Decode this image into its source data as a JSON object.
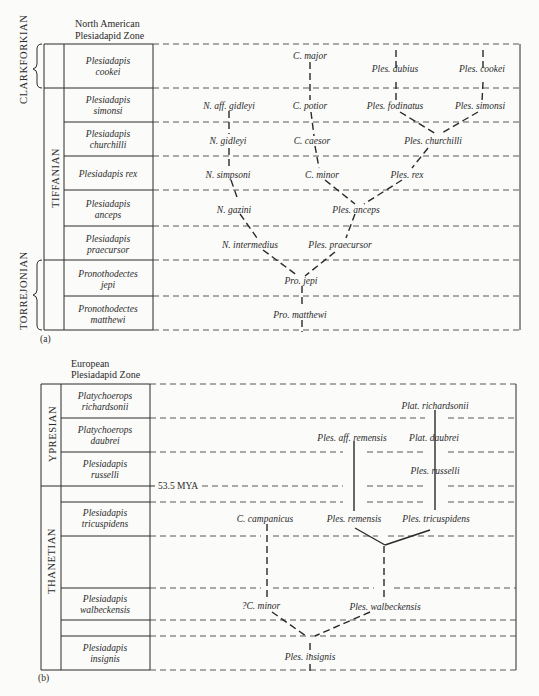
{
  "panel_a": {
    "label": "(a)",
    "header_line1": "North American",
    "header_line2": "Plesiadapid Zone",
    "eras": [
      {
        "name": "CLARKFORKIAN"
      },
      {
        "name": "TIFFANIAN"
      },
      {
        "name": "TORREJONIAN"
      }
    ],
    "zones": [
      {
        "line1": "Plesiadapis",
        "line2": "cookei"
      },
      {
        "line1": "Plesiadapis",
        "line2": "simonsi"
      },
      {
        "line1": "Plesiadapis",
        "line2": "churchilli"
      },
      {
        "line1": "Plesiadapis rex",
        "line2": ""
      },
      {
        "line1": "Plesiadapis",
        "line2": "anceps"
      },
      {
        "line1": "Plesiadapis",
        "line2": "praecursor"
      },
      {
        "line1": "Pronothodectes",
        "line2": "jepi"
      },
      {
        "line1": "Pronothodectes",
        "line2": "matthewi"
      }
    ],
    "taxa": {
      "c_major": "C. major",
      "ples_dubius": "Ples. dubius",
      "ples_cookei": "Ples. cookei",
      "n_aff_gidleyi": "N. aff. gidleyi",
      "c_potior": "C. potior",
      "ples_fodinatus": "Ples. fodinatus",
      "ples_simonsi": "Ples. simonsi",
      "n_gidleyi": "N. gidleyi",
      "c_caesor": "C. caesor",
      "ples_churchilli": "Ples. churchilli",
      "n_simpsoni": "N. simpsoni",
      "c_minor": "C. minor",
      "ples_rex": "Ples. rex",
      "n_gazini": "N. gazini",
      "ples_anceps": "Ples. anceps",
      "n_intermedius": "N. intermedius",
      "ples_praecursor": "Ples. praecursor",
      "pro_jepi": "Pro. jepi",
      "pro_matthewi": "Pro. matthewi"
    }
  },
  "panel_b": {
    "label": "(b)",
    "header_line1": "European",
    "header_line2": "Plesiadapid Zone",
    "eras": [
      {
        "name": "YPRESIAN"
      },
      {
        "name": "THANETIAN"
      }
    ],
    "zones": [
      {
        "line1": "Platychoerops",
        "line2": "richardsonii"
      },
      {
        "line1": "Platychoerops",
        "line2": "daubrei"
      },
      {
        "line1": "Plesiadapis",
        "line2": "russelli"
      },
      {
        "line1": "Plesiadapis",
        "line2": "tricuspidens"
      },
      {
        "line1": "Plesiadapis",
        "line2": "walbeckensis"
      },
      {
        "line1": "Plesiadapis",
        "line2": "insignis"
      }
    ],
    "boundary_label": "53.5 MYA",
    "taxa": {
      "plat_richardsonii": "Plat. richardsonii",
      "ples_aff_remensis": "Ples. aff. remensis",
      "plat_daubrei": "Plat. daubrei",
      "ples_russelli": "Ples. russelli",
      "c_campanicus": "C. campanicus",
      "ples_remensis": "Ples. remensis",
      "ples_tricuspidens": "Ples. tricuspidens",
      "c_minor_q": "?C. minor",
      "ples_walbeckensis": "Ples. walbeckensis",
      "ples_insignis": "Ples. insignis"
    }
  }
}
